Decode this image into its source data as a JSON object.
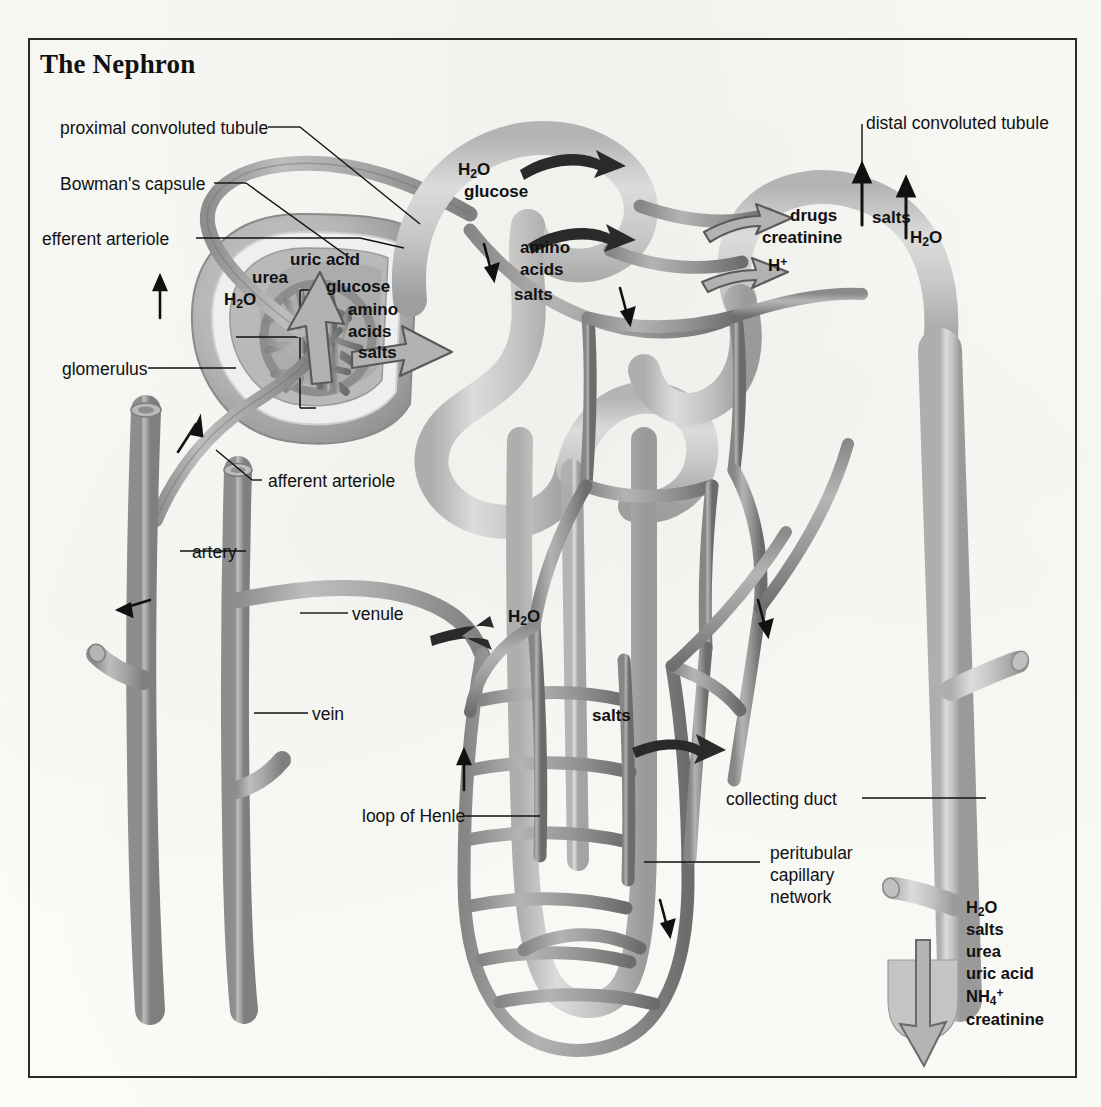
{
  "title": "The Nephron",
  "labels": {
    "proximal_convoluted_tubule": "proximal convoluted tubule",
    "bowmans_capsule": "Bowman's capsule",
    "efferent_arteriole": "efferent arteriole",
    "glomerulus": "glomerulus",
    "afferent_arteriole": "afferent arteriole",
    "artery": "artery",
    "venule": "venule",
    "vein": "vein",
    "loop_of_henle": "loop of Henle",
    "distal_convoluted_tubule": "distal convoluted tubule",
    "collecting_duct": "collecting duct",
    "peritubular_1": "peritubular",
    "peritubular_2": "capillary",
    "peritubular_3": "network"
  },
  "filtration": {
    "urea": "urea",
    "uric_acid": "uric acid",
    "h2o": "H",
    "h2o_sub": "2",
    "h2o_end": "O",
    "glucose": "glucose",
    "amino": "amino",
    "acids": "acids",
    "salts": "salts"
  },
  "reabsorption_pct": {
    "h2o": "H",
    "h2o_sub": "2",
    "h2o_end": "O",
    "glucose": "glucose",
    "amino": "amino",
    "acids": "acids",
    "salts": "salts"
  },
  "secretion": {
    "drugs": "drugs",
    "creatinine": "creatinine",
    "h_ion": "H",
    "h_ion_sup": "+"
  },
  "dct_reabsorption": {
    "salts": "salts",
    "h2o": "H",
    "h2o_sub": "2",
    "h2o_end": "O"
  },
  "loop_reabsorption": {
    "h2o": "H",
    "h2o_sub": "2",
    "h2o_end": "O",
    "salts": "salts"
  },
  "excretion": {
    "h2o": "H",
    "h2o_sub": "2",
    "h2o_end": "O",
    "salts": "salts",
    "urea": "urea",
    "uric_acid": "uric acid",
    "nh4": "NH",
    "nh4_sub": "4",
    "nh4_sup": "+",
    "creatinine": "creatinine"
  },
  "colors": {
    "frame": "#2b2b2b",
    "tubule_light": "#c9c9c9",
    "tubule_light_edge": "#a8a8a8",
    "capillary_mid": "#9a9a9a",
    "capillary_dark": "#7c7c7c",
    "vessel_gray": "#a5a5a5",
    "capsule_outer": "#bdbdbd",
    "capsule_inner": "#8e8e8e",
    "arrow_black": "#111111",
    "arrow_gray_fill": "#b0b0b0",
    "arrow_gray_stroke": "#5a5a5a",
    "text": "#111111",
    "background": "#fbfbf8"
  }
}
